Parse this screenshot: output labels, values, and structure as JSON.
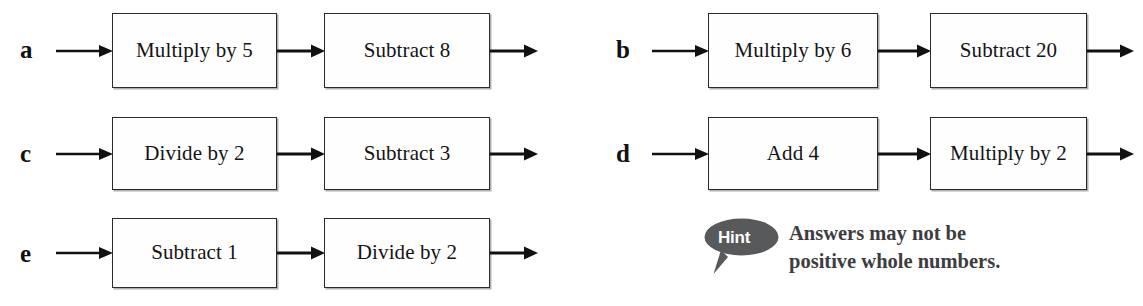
{
  "worksheet": {
    "chains": [
      {
        "label": "a",
        "steps": [
          "Multiply by 5",
          "Subtract 8"
        ]
      },
      {
        "label": "b",
        "steps": [
          "Multiply by 6",
          "Subtract 20"
        ]
      },
      {
        "label": "c",
        "steps": [
          "Divide by 2",
          "Subtract 3"
        ]
      },
      {
        "label": "d",
        "steps": [
          "Add 4",
          "Multiply by 2"
        ]
      },
      {
        "label": "e",
        "steps": [
          "Subtract 1",
          "Divide by 2"
        ]
      }
    ],
    "hint": {
      "badge": "Hint",
      "line1": "Answers may not be",
      "line2": "positive whole numbers.",
      "bubble_color": "#58595b",
      "text_color": "#3d3d40"
    },
    "colors": {
      "box_border": "#2b2b2b",
      "box_fill": "#fefefe",
      "arrow": "#111111",
      "page_background": "#ffffff"
    },
    "icons": {
      "arrow": "arrow-right-icon",
      "hint": "speech-bubble-icon"
    }
  }
}
